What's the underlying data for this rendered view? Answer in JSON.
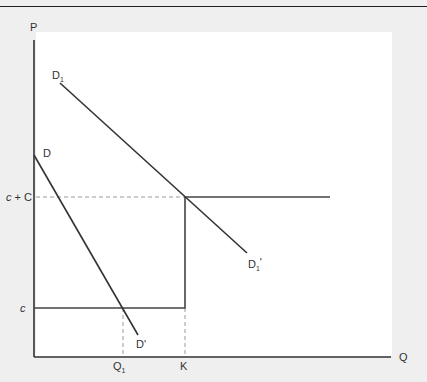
{
  "header": {
    "cut_off_title": "...capacity constrained capacity..."
  },
  "diagram": {
    "axes": {
      "y_label": "P",
      "x_label": "Q"
    },
    "price_levels": {
      "high_label": "c + C",
      "low_label": "c"
    },
    "quantity_marks": {
      "q1_label": "Q",
      "q1_sub": "1",
      "k_label": "K"
    },
    "curves": {
      "d_start_label": "D",
      "d_end_label": "D'",
      "d1_start_label": "D",
      "d1_start_sub": "1",
      "d1_end_label": "D",
      "d1_end_sub": "1",
      "d1_end_prime": "'"
    },
    "colors": {
      "line": "#333333",
      "dashed": "#999999",
      "plot_bg": "#ffffff",
      "page_bg": "#efefef"
    }
  }
}
